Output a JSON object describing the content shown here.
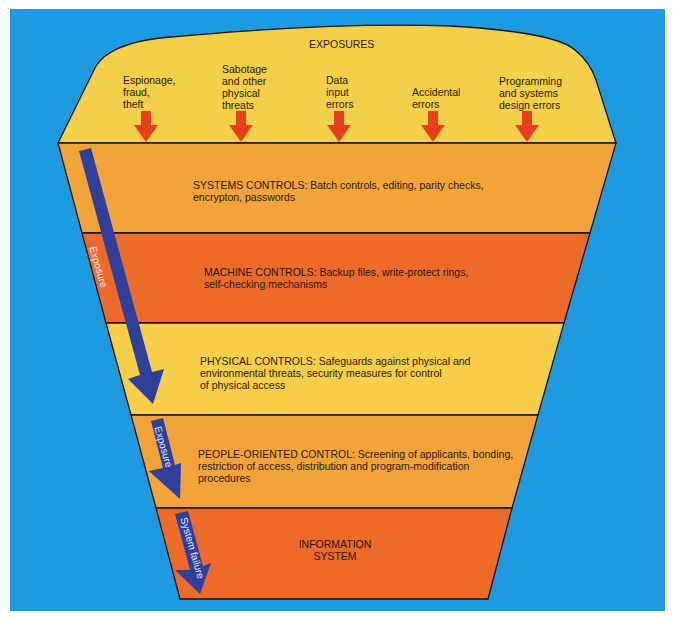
{
  "title": "EXPOSURES",
  "exposures": [
    {
      "label": "Espionage,\nfraud,\ntheft",
      "lines": [
        "Espionage,",
        "fraud,",
        "theft"
      ]
    },
    {
      "label": "Sabotage\nand other\nphysical\nthreats",
      "lines": [
        "Sabotage",
        "and other",
        "physical",
        "threats"
      ]
    },
    {
      "label": "Data\ninput\nerrors",
      "lines": [
        "Data",
        "input",
        "errors"
      ]
    },
    {
      "label": "Accidental\nerrors",
      "lines": [
        "Accidental",
        "errors"
      ]
    },
    {
      "label": "Programming\nand systems\ndesign errors",
      "lines": [
        "Programming",
        "and systems",
        "design errors"
      ]
    }
  ],
  "layers": [
    {
      "name": "systems-controls",
      "lines": [
        "SYSTEMS CONTROLS: Batch controls, editing, parity checks,",
        "encrypton, passwords"
      ],
      "color": "#f2a43a"
    },
    {
      "name": "machine-controls",
      "lines": [
        "MACHINE CONTROLS: Backup files, write-protect rings,",
        "self-checking mechanisms"
      ],
      "color": "#ec6a2a"
    },
    {
      "name": "physical-controls",
      "lines": [
        "PHYSICAL CONTROLS: Safeguards against physical and",
        "environmental threats, security measures for control",
        "of physical access"
      ],
      "color": "#f6ce47"
    },
    {
      "name": "people-oriented-control",
      "lines": [
        "PEOPLE-ORIENTED CONTROL: Screening of applicants, bonding,",
        "restriction of access, distribution and program-modification",
        "procedures"
      ],
      "color": "#f2a43a"
    },
    {
      "name": "information-system",
      "lines": [
        "INFORMATION",
        "SYSTEM"
      ],
      "color": "#ec6a2a"
    }
  ],
  "flow_arrows": [
    {
      "label": "Exposure"
    },
    {
      "label": "Exposure"
    },
    {
      "label": "System failure"
    }
  ],
  "colors": {
    "background": "#1e9be0",
    "exposure_cap": "#f4cf4a",
    "threat_arrow": "#e8401e",
    "flow_arrow": "#2e3f9c",
    "outline": "#1a1208"
  }
}
